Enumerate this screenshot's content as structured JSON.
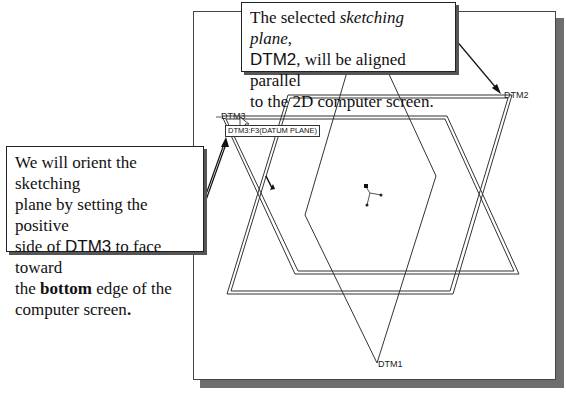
{
  "callouts": {
    "top": {
      "line1_prefix": "The selected ",
      "line1_italic": "sketching plane",
      "line1_suffix": ",",
      "line2_datum": "DTM2",
      "line2_suffix": ", will be aligned parallel",
      "line3": "to the 2D computer screen."
    },
    "left": {
      "line1": "We will orient the sketching",
      "line2": "plane by setting the positive",
      "line3_prefix": "side of ",
      "line3_datum": "DTM3",
      "line3_suffix": " to face toward",
      "line4_prefix": "the ",
      "line4_bold": "bottom",
      "line4_suffix": " edge of the",
      "line5_prefix": "computer screen",
      "line5_bold": "."
    }
  },
  "viewport": {
    "datum_labels": {
      "dtm1": "DTM1",
      "dtm2": "DTM2",
      "dtm3": "DTM3"
    },
    "tooltip": "DTM3:F3(DATUM PLANE)",
    "icons": [
      "mouse-cursor-icon",
      "csys-triad-icon",
      "direction-arrow-icon"
    ]
  },
  "colors": {
    "plane_line": "#333333",
    "shadow": "#6e6e6e",
    "text": "#111111"
  }
}
